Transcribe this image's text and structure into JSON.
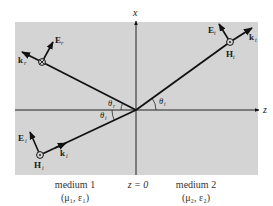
{
  "diagram": {
    "colors": {
      "panel_bg": "#d4d4d4",
      "line": "#111111",
      "text": "#1a1a1a"
    },
    "axes": {
      "x_label": "x",
      "z_label": "z",
      "interface_label": "z = 0"
    },
    "incident": {
      "E_label": "E",
      "E_sub": "i",
      "H_label": "H",
      "H_sub": "i",
      "k_label": "k",
      "k_sub": "i",
      "angle_label": "θ",
      "angle_sub": "i",
      "H_symbol": "dot-in-circle"
    },
    "reflected": {
      "E_label": "E",
      "E_sub": "r",
      "k_label": "k",
      "k_sub": "r",
      "angle_label": "θ",
      "angle_sub": "r",
      "H_symbol": "cross-in-circle"
    },
    "transmitted": {
      "E_label": "E",
      "E_sub": "t",
      "H_label": "H",
      "H_sub": "t",
      "k_label": "k",
      "k_sub": "t",
      "angle_label": "θ",
      "angle_sub": "t",
      "H_symbol": "dot-in-circle"
    },
    "media": [
      {
        "name": "medium 1",
        "params": "(μ₁, ε₁)"
      },
      {
        "name": "medium 2",
        "params": "(μ₂, ε₂)"
      }
    ]
  }
}
